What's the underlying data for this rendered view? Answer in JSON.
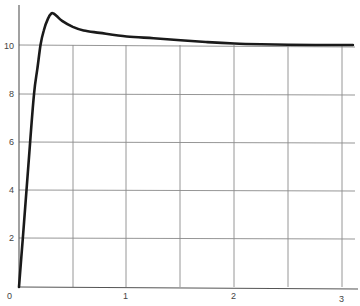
{
  "chart_data": {
    "type": "line",
    "title": "",
    "xlabel": "",
    "ylabel": "",
    "xlim": [
      0,
      3
    ],
    "ylim": [
      0,
      11.7
    ],
    "grid": true,
    "x_ticks": [
      "0",
      "1",
      "2",
      "3"
    ],
    "y_ticks": [
      "0",
      "2",
      "4",
      "6",
      "8",
      "10"
    ],
    "series": [
      {
        "name": "response",
        "color": "#1a1a1a",
        "x": [
          0,
          0.035,
          0.07,
          0.1,
          0.14,
          0.17,
          0.2,
          0.23,
          0.27,
          0.3,
          0.32,
          0.35,
          0.4,
          0.5,
          0.6,
          0.75,
          1.0,
          1.25,
          1.5,
          1.75,
          2.0,
          2.25,
          2.5,
          2.75,
          3.0,
          3.1
        ],
        "values": [
          0,
          2.0,
          4.0,
          5.8,
          8.0,
          9.0,
          10.0,
          10.6,
          11.1,
          11.3,
          11.3,
          11.2,
          11.0,
          10.75,
          10.6,
          10.5,
          10.35,
          10.28,
          10.2,
          10.12,
          10.06,
          10.03,
          10.01,
          10.0,
          10.0,
          10.0
        ]
      }
    ]
  },
  "labels": {
    "x0": "0",
    "x1": "1",
    "x2": "2",
    "x3": "3",
    "y2": "2",
    "y4": "4",
    "y6": "6",
    "y8": "8",
    "y10": "10"
  }
}
